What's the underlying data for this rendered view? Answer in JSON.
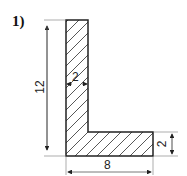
{
  "problem": {
    "number_label": "1)"
  },
  "dimensions": {
    "height": "12",
    "vertical_leg_width": "2",
    "base_length": "8",
    "horizontal_leg_height": "2"
  },
  "colors": {
    "stroke": "#222222",
    "hatch": "#444444",
    "dim_line": "#555555",
    "background": "#ffffff"
  }
}
